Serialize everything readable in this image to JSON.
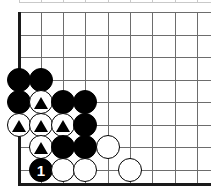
{
  "diagram": {
    "kind": "go-board-corner-diagram",
    "width": 211,
    "height": 192,
    "background_color": "#ffffff",
    "board": {
      "line_color": "#6d6d6d",
      "faint_line_color": "#c9c9c9",
      "edge_color": "#1a1a1a",
      "edge_thickness": 3,
      "grid_spacing": 22.4,
      "left_edge_x": 19,
      "bottom_edge_y": 183,
      "vertical_lines_x": [
        19,
        41,
        63,
        85,
        108,
        130,
        152,
        175,
        197
      ],
      "horizontal_lines_y": [
        12,
        35,
        57,
        80,
        102,
        125,
        147,
        170
      ],
      "partial_top_row_y": 2
    },
    "stone_radius": 12,
    "colors": {
      "black_stone": "#000000",
      "white_stone": "#ffffff",
      "stone_outline": "#000000",
      "label_text": "#ffffff",
      "marker": "#000000"
    },
    "stones": [
      {
        "id": "b-1",
        "color": "black",
        "x": 19,
        "y": 80,
        "marker": "none",
        "label": ""
      },
      {
        "id": "b-2",
        "color": "black",
        "x": 41,
        "y": 80,
        "marker": "none",
        "label": ""
      },
      {
        "id": "b-3",
        "color": "black",
        "x": 19,
        "y": 102,
        "marker": "none",
        "label": ""
      },
      {
        "id": "w-1",
        "color": "white",
        "x": 41,
        "y": 102,
        "marker": "triangle",
        "label": ""
      },
      {
        "id": "b-4",
        "color": "black",
        "x": 63,
        "y": 102,
        "marker": "none",
        "label": ""
      },
      {
        "id": "b-5",
        "color": "black",
        "x": 85,
        "y": 102,
        "marker": "none",
        "label": ""
      },
      {
        "id": "w-2",
        "color": "white",
        "x": 19,
        "y": 125,
        "marker": "triangle",
        "label": ""
      },
      {
        "id": "w-3",
        "color": "white",
        "x": 41,
        "y": 125,
        "marker": "triangle",
        "label": ""
      },
      {
        "id": "w-4",
        "color": "white",
        "x": 63,
        "y": 125,
        "marker": "triangle",
        "label": ""
      },
      {
        "id": "b-6",
        "color": "black",
        "x": 85,
        "y": 125,
        "marker": "none",
        "label": ""
      },
      {
        "id": "w-5",
        "color": "white",
        "x": 41,
        "y": 147,
        "marker": "triangle",
        "label": ""
      },
      {
        "id": "b-7",
        "color": "black",
        "x": 63,
        "y": 147,
        "marker": "none",
        "label": ""
      },
      {
        "id": "b-8",
        "color": "black",
        "x": 85,
        "y": 147,
        "marker": "none",
        "label": ""
      },
      {
        "id": "w-6",
        "color": "white",
        "x": 108,
        "y": 147,
        "marker": "none",
        "label": ""
      },
      {
        "id": "b-9",
        "color": "black",
        "x": 41,
        "y": 170,
        "marker": "none",
        "label": "1"
      },
      {
        "id": "w-7",
        "color": "white",
        "x": 63,
        "y": 170,
        "marker": "none",
        "label": ""
      },
      {
        "id": "w-8",
        "color": "white",
        "x": 85,
        "y": 170,
        "marker": "none",
        "label": ""
      },
      {
        "id": "w-9",
        "color": "white",
        "x": 130,
        "y": 170,
        "marker": "none",
        "label": ""
      }
    ]
  }
}
